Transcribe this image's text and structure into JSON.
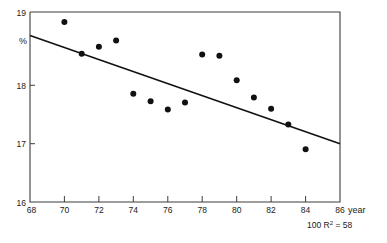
{
  "chart_data": {
    "type": "scatter",
    "title": "",
    "subtitle": "",
    "xlabel": "year",
    "ylabel": "%",
    "xlim": [
      68,
      86
    ],
    "ylim": [
      16,
      19
    ],
    "grid": false,
    "legend": null,
    "x_ticks": [
      68,
      70,
      72,
      74,
      76,
      78,
      80,
      82,
      84,
      86
    ],
    "x_tick_labels": [
      "68",
      "70",
      "72",
      "74",
      "76",
      "78",
      "80",
      "82",
      "84",
      "86"
    ],
    "y_ticks": [
      16,
      17,
      18,
      19
    ],
    "y_tick_labels": [
      "16",
      "17",
      "18",
      "19"
    ],
    "x": [
      70,
      71,
      72,
      73,
      74,
      75,
      76,
      77,
      78,
      79,
      80,
      81,
      82,
      83,
      84
    ],
    "values": [
      18.84,
      18.34,
      18.45,
      18.55,
      17.71,
      17.59,
      17.46,
      17.57,
      18.33,
      18.31,
      17.92,
      17.65,
      17.47,
      17.22,
      16.83
    ],
    "points": [
      {
        "x": 70,
        "y": 18.84
      },
      {
        "x": 71,
        "y": 18.34
      },
      {
        "x": 72,
        "y": 18.45
      },
      {
        "x": 73,
        "y": 18.55
      },
      {
        "x": 74,
        "y": 17.71
      },
      {
        "x": 75,
        "y": 17.59
      },
      {
        "x": 76,
        "y": 17.46
      },
      {
        "x": 77,
        "y": 17.57
      },
      {
        "x": 78,
        "y": 18.33
      },
      {
        "x": 79,
        "y": 18.31
      },
      {
        "x": 80,
        "y": 17.92
      },
      {
        "x": 81,
        "y": 17.65
      },
      {
        "x": 82,
        "y": 17.47
      },
      {
        "x": 83,
        "y": 17.22
      },
      {
        "x": 84,
        "y": 16.83
      }
    ],
    "trendline": {
      "name": "regression line",
      "x_start": 68,
      "y_start": 18.63,
      "x_end": 86,
      "y_end": 17.0
    },
    "annotations": [
      {
        "name": "x-axis-unit",
        "text": "year"
      },
      {
        "name": "y-axis-unit",
        "text": "%"
      },
      {
        "name": "r-squared",
        "text": "100 R",
        "superscript": "2",
        "tail": " = 58",
        "full": "100 R2 = 58"
      }
    ],
    "colors": {
      "point": "#111111",
      "line": "#111111",
      "axis": "#3c3c3c",
      "text": "#1a1a1a",
      "background": "#ffffff"
    }
  },
  "axis": {
    "x_unit_label": "year",
    "y_unit_label": "%"
  },
  "stats": {
    "r_squared_prefix": "100 R",
    "r_squared_exponent": "2",
    "r_squared_value": " = 58"
  }
}
